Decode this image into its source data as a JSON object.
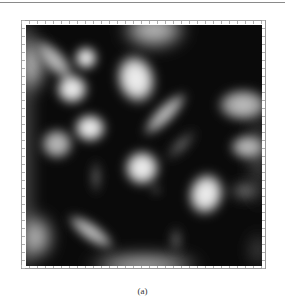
{
  "figure": {
    "caption": "(a)",
    "type": "density-plot",
    "colormap": "grayscale",
    "colors": {
      "background": "#0a0a0a",
      "highlight": "#f2f2f2",
      "frame": "#9a9a9a"
    }
  }
}
